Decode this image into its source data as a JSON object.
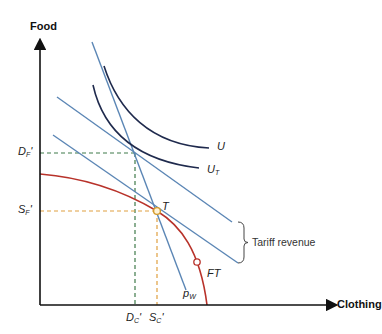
{
  "diagram": {
    "type": "trade-tariff-equilibrium",
    "axes": {
      "y_label": "Food",
      "x_label": "Clothing"
    },
    "labels": {
      "U": {
        "main": "U",
        "sub": ""
      },
      "UT": {
        "main": "U",
        "sub": "T"
      },
      "DF": {
        "main": "D",
        "sub": "F",
        "prime": "'"
      },
      "SF": {
        "main": "S",
        "sub": "F",
        "prime": "'"
      },
      "DC": {
        "main": "D",
        "sub": "C",
        "prime": "'"
      },
      "SC": {
        "main": "S",
        "sub": "C",
        "prime": "'"
      },
      "T": "T",
      "FT": "FT",
      "PW": {
        "main": "p",
        "sub": "W"
      },
      "tariff_revenue": "Tariff revenue"
    },
    "colors": {
      "axis": "#111111",
      "budget_lines": "#5b86b5",
      "indifference_curves": "#1f2a4d",
      "ppf": "#b8322a",
      "demand_guides": "#3f7a4a",
      "supply_guides": "#e0a040",
      "point_fill": "#fff3d6",
      "point_stroke": "#d39a2a"
    }
  }
}
